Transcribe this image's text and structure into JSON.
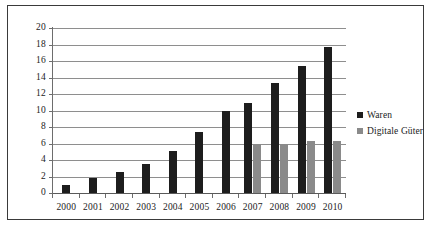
{
  "chart_data": {
    "type": "bar",
    "title": "",
    "subtitle": "",
    "xlabel": "",
    "ylabel": "",
    "categories": [
      "2000",
      "2001",
      "2002",
      "2003",
      "2004",
      "2005",
      "2006",
      "2007",
      "2008",
      "2009",
      "2010"
    ],
    "series": [
      {
        "name": "Waren",
        "color": "#1d1d1d",
        "values": [
          1.0,
          1.8,
          2.6,
          3.5,
          5.1,
          7.4,
          10.0,
          10.9,
          13.3,
          15.4,
          17.7
        ]
      },
      {
        "name": "Digitale Güter",
        "color": "#8a8a8a",
        "values": [
          null,
          null,
          null,
          null,
          null,
          null,
          null,
          5.9,
          5.9,
          6.25,
          6.3
        ]
      }
    ],
    "ylim": [
      0,
      20
    ],
    "ytick_step": 2,
    "yticks": [
      "0",
      "2",
      "4",
      "6",
      "8",
      "10",
      "12",
      "14",
      "16",
      "18",
      "20"
    ],
    "grid": true,
    "legend_position": "right",
    "annotations": []
  },
  "legend": {
    "items": [
      {
        "label": "Waren",
        "color": "#1d1d1d"
      },
      {
        "label": "Digitale Güter",
        "color": "#8a8a8a"
      }
    ]
  },
  "colors": {
    "waren": "#1d1d1d",
    "digital": "#8a8a8a",
    "gridline": "#8e8e8e",
    "axis": "#5a5a5a",
    "frame": "#3a3a3a",
    "text": "#1b1b1b",
    "background": "#ffffff"
  }
}
